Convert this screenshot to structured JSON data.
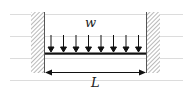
{
  "diagram": {
    "load_label": "w",
    "span_label": "L",
    "num_load_arrows": 8,
    "supports": [
      "fixed-left",
      "fixed-right"
    ],
    "colors": {
      "ink": "#111111",
      "hatch": "#888888",
      "guide_lines": "#dddddd"
    }
  }
}
